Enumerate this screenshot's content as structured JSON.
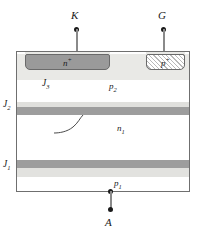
{
  "figure": {
    "terminals": [
      {
        "id": "cathode",
        "label": "K",
        "x": 76,
        "y": 14
      },
      {
        "id": "gate",
        "label": "G",
        "x": 163,
        "y": 14
      },
      {
        "id": "anode",
        "label": "A",
        "x": 110,
        "y": 222
      }
    ],
    "regions": [
      {
        "id": "n-plus",
        "label": "n",
        "sup": "+",
        "type": "emitter-contact"
      },
      {
        "id": "p-plus",
        "label": "p",
        "sup": "+",
        "type": "gate-contact"
      },
      {
        "id": "p2",
        "label": "p",
        "sub": "2",
        "type": "base"
      },
      {
        "id": "n1",
        "label": "n",
        "sub": "1",
        "type": "base"
      },
      {
        "id": "p1",
        "label": "p",
        "sub": "1",
        "type": "emitter"
      }
    ],
    "junctions": [
      {
        "id": "j3",
        "label": "J",
        "sub": "3"
      },
      {
        "id": "j2",
        "label": "J",
        "sub": "2"
      },
      {
        "id": "j1",
        "label": "J",
        "sub": "1"
      }
    ],
    "colors": {
      "outline": "#6f6f6f",
      "lead": "#8a8a8a",
      "dot": "#1a1a1a",
      "metal_contact": "#9a9a9a",
      "p2_fill": "#e9e9e6",
      "junction_dark": "#9d9d9d",
      "junction_light": "#e0e0dd",
      "background": "#ffffff"
    }
  }
}
